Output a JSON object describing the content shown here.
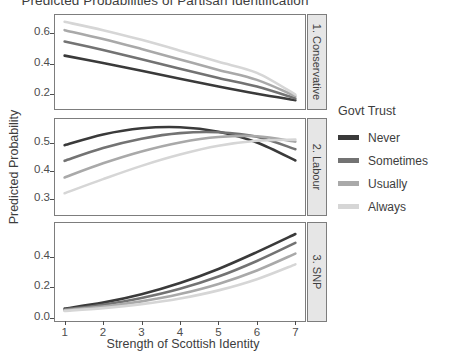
{
  "chart_data": {
    "type": "line",
    "title": "Predicted Probabilities of Partisan Identification",
    "xlabel": "Strength of Scottish Identity",
    "ylabel": "Predicted Probability",
    "legend_title": "Govt Trust",
    "legend_position": "right",
    "grid": false,
    "x": [
      1,
      2,
      3,
      4,
      5,
      6,
      7
    ],
    "xlim": [
      0.75,
      7.25
    ],
    "xticks": [
      "1",
      "2",
      "3",
      "4",
      "5",
      "6",
      "7"
    ],
    "colors": {
      "Never": "#3a3a3a",
      "Sometimes": "#737373",
      "Usually": "#a9a9a9",
      "Always": "#d6d6d6"
    },
    "panels": [
      {
        "label": "1. Conservative",
        "ylim": [
          0.1,
          0.72
        ],
        "yticks": [
          "0.2",
          "0.4",
          "0.6"
        ],
        "ytick_values": [
          0.2,
          0.4,
          0.6
        ],
        "series": [
          {
            "name": "Never",
            "values": [
              0.452,
              0.404,
              0.352,
              0.3,
              0.248,
              0.2,
              0.158
            ]
          },
          {
            "name": "Sometimes",
            "values": [
              0.545,
              0.489,
              0.428,
              0.366,
              0.305,
              0.248,
              0.17
            ]
          },
          {
            "name": "Usually",
            "values": [
              0.62,
              0.562,
              0.496,
              0.427,
              0.358,
              0.292,
              0.185
            ]
          },
          {
            "name": "Always",
            "values": [
              0.675,
              0.62,
              0.556,
              0.485,
              0.411,
              0.338,
              0.195
            ]
          }
        ]
      },
      {
        "label": "2. Labour",
        "ylim": [
          0.245,
          0.585
        ],
        "yticks": [
          "0.3",
          "0.4",
          "0.5"
        ],
        "ytick_values": [
          0.3,
          0.4,
          0.5
        ],
        "series": [
          {
            "name": "Never",
            "values": [
              0.492,
              0.53,
              0.552,
              0.556,
              0.54,
              0.502,
              0.438
            ]
          },
          {
            "name": "Sometimes",
            "values": [
              0.437,
              0.482,
              0.515,
              0.535,
              0.538,
              0.522,
              0.478
            ]
          },
          {
            "name": "Usually",
            "values": [
              0.378,
              0.428,
              0.47,
              0.502,
              0.521,
              0.524,
              0.505
            ]
          },
          {
            "name": "Always",
            "values": [
              0.322,
              0.372,
              0.419,
              0.459,
              0.49,
              0.508,
              0.512
            ]
          }
        ]
      },
      {
        "label": "3. SNP",
        "ylim": [
          -0.02,
          0.62
        ],
        "yticks": [
          "0.0",
          "0.2",
          "0.4"
        ],
        "ytick_values": [
          0.0,
          0.2,
          0.4
        ],
        "series": [
          {
            "name": "Never",
            "values": [
              0.061,
              0.1,
              0.155,
              0.228,
              0.32,
              0.43,
              0.548
            ]
          },
          {
            "name": "Sometimes",
            "values": [
              0.055,
              0.086,
              0.13,
              0.19,
              0.27,
              0.372,
              0.49
            ]
          },
          {
            "name": "Usually",
            "values": [
              0.05,
              0.074,
              0.108,
              0.156,
              0.222,
              0.31,
              0.42
            ]
          },
          {
            "name": "Always",
            "values": [
              0.046,
              0.064,
              0.09,
              0.127,
              0.18,
              0.253,
              0.35
            ]
          }
        ]
      }
    ]
  },
  "legend": {
    "title": "Govt Trust",
    "items": [
      {
        "label": "Never",
        "color": "#3a3a3a"
      },
      {
        "label": "Sometimes",
        "color": "#737373"
      },
      {
        "label": "Usually",
        "color": "#a9a9a9"
      },
      {
        "label": "Always",
        "color": "#d6d6d6"
      }
    ]
  }
}
